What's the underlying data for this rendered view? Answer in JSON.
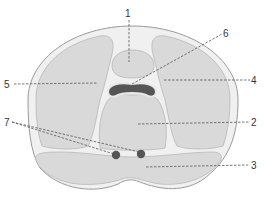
{
  "diagram": {
    "type": "anatomical-cross-section",
    "colors": {
      "background": "#ffffff",
      "outer_fill": "#f0f0f0",
      "outline": "#9a9a9a",
      "muscle_fill": "#d9d9d9",
      "bone_fill": "#555555",
      "vessel_fill": "#555555",
      "leader_line": "#555555",
      "label_text": "#333333"
    },
    "labels": [
      {
        "id": "1",
        "text": "1",
        "x": 128,
        "y": 16
      },
      {
        "id": "2",
        "text": "2",
        "x": 253,
        "y": 125
      },
      {
        "id": "3",
        "text": "3",
        "x": 253,
        "y": 169
      },
      {
        "id": "4",
        "text": "4",
        "x": 253,
        "y": 84
      },
      {
        "id": "5",
        "text": "5",
        "x": 7,
        "y": 88
      },
      {
        "id": "6",
        "text": "6",
        "x": 224,
        "y": 36
      },
      {
        "id": "7",
        "text": "7",
        "x": 7,
        "y": 126
      }
    ]
  }
}
